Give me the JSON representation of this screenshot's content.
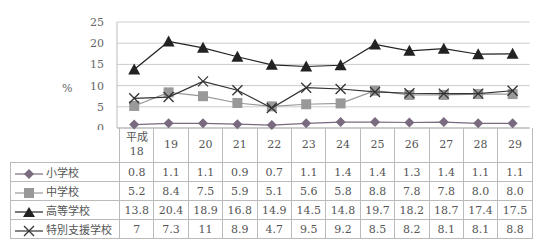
{
  "chart_data": {
    "type": "line",
    "title": "",
    "xlabel": "",
    "ylabel": "%",
    "ylim": [
      0,
      25
    ],
    "yticks": [
      0,
      5,
      10,
      15,
      20,
      25
    ],
    "grid": true,
    "legend_position": "table-left",
    "categories": [
      "平成18",
      "19",
      "20",
      "21",
      "22",
      "23",
      "24",
      "25",
      "26",
      "27",
      "28",
      "29"
    ],
    "category_labels": [
      [
        "平成",
        "18"
      ],
      [
        "19"
      ],
      [
        "20"
      ],
      [
        "21"
      ],
      [
        "22"
      ],
      [
        "23"
      ],
      [
        "24"
      ],
      [
        "25"
      ],
      [
        "26"
      ],
      [
        "27"
      ],
      [
        "28"
      ],
      [
        "29"
      ]
    ],
    "series": [
      {
        "name": "小学校",
        "marker": "diamond",
        "color": "#7a6a80",
        "values": [
          0.8,
          1.1,
          1.1,
          0.9,
          0.7,
          1.1,
          1.4,
          1.4,
          1.3,
          1.4,
          1.1,
          1.1
        ],
        "labels": [
          "0.8",
          "1.1",
          "1.1",
          "0.9",
          "0.7",
          "1.1",
          "1.4",
          "1.4",
          "1.3",
          "1.4",
          "1.1",
          "1.1"
        ]
      },
      {
        "name": "中学校",
        "marker": "square",
        "color": "#999999",
        "values": [
          5.2,
          8.4,
          7.5,
          5.9,
          5.1,
          5.6,
          5.8,
          8.8,
          7.8,
          7.8,
          8.0,
          8.0
        ],
        "labels": [
          "5.2",
          "8.4",
          "7.5",
          "5.9",
          "5.1",
          "5.6",
          "5.8",
          "8.8",
          "7.8",
          "7.8",
          "8.0",
          "8.0"
        ]
      },
      {
        "name": "高等学校",
        "marker": "triangle",
        "color": "#222222",
        "values": [
          13.8,
          20.4,
          18.9,
          16.8,
          14.9,
          14.5,
          14.8,
          19.7,
          18.2,
          18.7,
          17.4,
          17.5
        ],
        "labels": [
          "13.8",
          "20.4",
          "18.9",
          "16.8",
          "14.9",
          "14.5",
          "14.8",
          "19.7",
          "18.2",
          "18.7",
          "17.4",
          "17.5"
        ]
      },
      {
        "name": "特別支援学校",
        "marker": "x",
        "color": "#333333",
        "values": [
          7,
          7.3,
          11,
          8.9,
          4.7,
          9.5,
          9.2,
          8.5,
          8.2,
          8.1,
          8.1,
          8.8
        ],
        "labels": [
          "7",
          "7.3",
          "11",
          "8.9",
          "4.7",
          "9.5",
          "9.2",
          "8.5",
          "8.2",
          "8.1",
          "8.1",
          "8.8"
        ]
      }
    ]
  }
}
